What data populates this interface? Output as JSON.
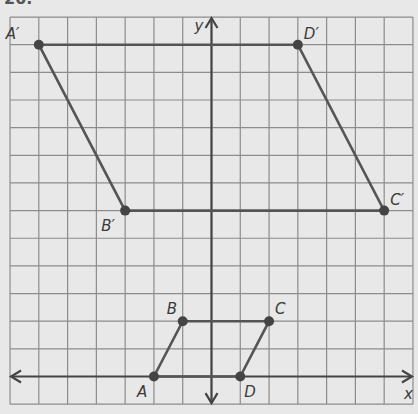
{
  "problem_number": "20.",
  "colors": {
    "background": "#e8e8e8",
    "grid": "#8c8c8c",
    "figure": "#555555",
    "point": "#444444",
    "axis": "#444444"
  },
  "grid": {
    "x_min": -7,
    "x_max": 7,
    "y_min": -1,
    "y_max": 13,
    "origin_px": [
      211.5,
      376.5
    ],
    "unit_x_px": 28.78,
    "unit_y_px": 27.65
  },
  "axes": {
    "x_label": "x",
    "y_label": "y"
  },
  "figures": [
    {
      "name": "ABCD",
      "vertices": [
        {
          "label": "A",
          "x": -2,
          "y": 0,
          "lx": -17,
          "ly": 20
        },
        {
          "label": "B",
          "x": -1,
          "y": 2,
          "lx": -16,
          "ly": -7
        },
        {
          "label": "C",
          "x": 2,
          "y": 2,
          "lx": 6,
          "ly": -7
        },
        {
          "label": "D",
          "x": 1,
          "y": 0,
          "lx": 4,
          "ly": 20
        }
      ]
    },
    {
      "name": "A'B'C'D'",
      "vertices": [
        {
          "label": "A′",
          "x": -6,
          "y": 12,
          "lx": -33,
          "ly": -6
        },
        {
          "label": "B′",
          "x": -3,
          "y": 6,
          "lx": -24,
          "ly": 20
        },
        {
          "label": "C′",
          "x": 6,
          "y": 6,
          "lx": 6,
          "ly": -6
        },
        {
          "label": "D′",
          "x": 3,
          "y": 12,
          "lx": 6,
          "ly": -6
        }
      ]
    }
  ]
}
